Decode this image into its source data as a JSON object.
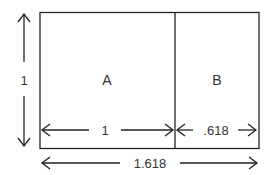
{
  "diagram": {
    "regions": {
      "a": "A",
      "b": "B"
    },
    "dimensions": {
      "height": "1",
      "width_a": "1",
      "width_b": ".618",
      "total_width": "1.618"
    },
    "colors": {
      "stroke": "#222222",
      "text": "#333333"
    }
  }
}
